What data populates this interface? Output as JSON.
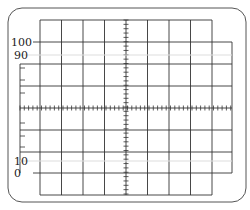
{
  "figure": {
    "type": "oscilloscope-graticule",
    "major_divisions": {
      "horizontal": 9,
      "vertical": 8
    },
    "labels": [
      {
        "text": "100",
        "y": 42
      },
      {
        "text": "90",
        "y": 55
      },
      {
        "text": "10",
        "y": 161
      },
      {
        "text": "0",
        "y": 173
      }
    ],
    "colors": {
      "line": "#333333",
      "frame": "#555555",
      "background": "#ffffff"
    }
  }
}
